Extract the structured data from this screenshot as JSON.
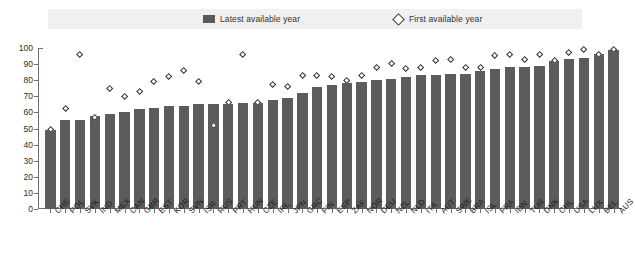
{
  "title": {
    "cropped_text": ""
  },
  "legend": {
    "items": [
      {
        "label": "Latest available year",
        "marker": "bar-swatch-icon",
        "color": "#5c5c5c"
      },
      {
        "label": "First available year",
        "marker": "diamond-icon",
        "color": "#ffffff"
      }
    ]
  },
  "chart_data": {
    "type": "bar",
    "title": "",
    "xlabel": "",
    "ylabel": "",
    "ylim": [
      0,
      100
    ],
    "ytick_step": 10,
    "yticks": [
      0,
      10,
      20,
      30,
      40,
      50,
      60,
      70,
      80,
      90,
      100
    ],
    "grid": false,
    "legend_position": "top",
    "categories": [
      "CHE",
      "POL",
      "SVK",
      "IND",
      "MEX",
      "CAN",
      "GBR",
      "EST",
      "KOR",
      "SVN",
      "ISR",
      "RUS",
      "PRT",
      "HUN",
      "CZE",
      "IRL",
      "JPN",
      "GRC",
      "FIN",
      "ESP",
      "ZAF",
      "NOR",
      "DEU",
      "NZL",
      "NLD",
      "ITA",
      "AUT",
      "SWE",
      "BRA",
      "ISL",
      "FRA",
      "IDN",
      "TUR",
      "DNK",
      "CHL",
      "USA",
      "LUX",
      "BEL",
      "AUS"
    ],
    "series": [
      {
        "name": "Latest available year",
        "marker": "bar",
        "color": "#5c5c5c",
        "values": [
          49,
          55,
          55,
          58,
          59,
          60,
          62,
          63,
          64,
          64,
          65,
          65,
          65,
          66,
          66,
          68,
          69,
          72,
          76,
          77,
          78,
          79,
          80,
          81,
          82,
          83,
          83,
          84,
          84,
          86,
          87,
          88,
          88,
          89,
          92,
          93,
          94,
          96,
          99
        ]
      },
      {
        "name": "First available year",
        "marker": "diamond",
        "color": "#ffffff",
        "edgecolor": "#2e2e2e",
        "values": [
          49,
          62,
          96,
          57,
          75,
          70,
          73,
          79,
          82,
          86,
          79,
          52,
          66,
          96,
          66,
          77,
          76,
          83,
          83,
          82,
          80,
          83,
          88,
          90,
          87,
          88,
          92,
          93,
          88,
          88,
          95,
          96,
          93,
          96,
          92,
          97,
          99,
          96,
          99
        ]
      }
    ]
  }
}
